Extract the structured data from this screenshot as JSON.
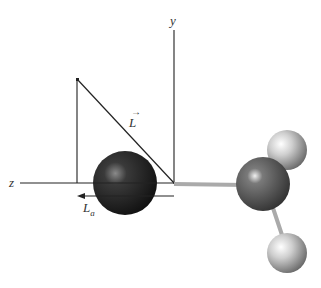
{
  "labels": {
    "y_axis": "y",
    "z_axis": "z",
    "L_vector": "L",
    "L_a_main": "L",
    "L_a_sub": "a"
  },
  "colors": {
    "heavy_atom": "#2a2a2a",
    "central_atom": "#5a5a5a",
    "light_atom": "#d8d8d8",
    "line": "#222222",
    "bond": "#aaaaaa"
  }
}
